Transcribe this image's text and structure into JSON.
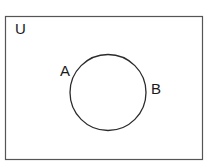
{
  "diagram": {
    "type": "venn",
    "universe_label": "U",
    "sets": [
      {
        "label": "A"
      },
      {
        "label": "B"
      }
    ],
    "relation": "A = B (single circle labeled A and B)",
    "colors": {
      "stroke": "#2b2b2b",
      "universe_stroke": "#555555",
      "background": "#ffffff"
    }
  }
}
